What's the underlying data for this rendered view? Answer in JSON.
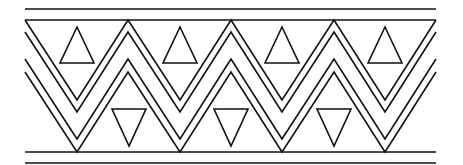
{
  "figure": {
    "colors": {
      "stroke": "#111111",
      "background": "#ffffff"
    },
    "bounds": {
      "left": 25,
      "right": 436
    },
    "horizontal_lines_y": [
      9,
      20,
      152,
      163
    ],
    "zigzag": {
      "peak_x": [
        25,
        128,
        231,
        334,
        436
      ],
      "valley_x": [
        77,
        180,
        282,
        385
      ],
      "bands": [
        {
          "peak_y": 20,
          "valley_y": 100
        },
        {
          "peak_y": 32,
          "valley_y": 112
        },
        {
          "peak_y": 59,
          "valley_y": 139
        },
        {
          "peak_y": 72,
          "valley_y": 152
        }
      ]
    },
    "up_triangles": [
      {
        "cx": 77,
        "apex_y": 27,
        "base_y": 63,
        "half_width": 17
      },
      {
        "cx": 180,
        "apex_y": 27,
        "base_y": 63,
        "half_width": 17
      },
      {
        "cx": 282,
        "apex_y": 27,
        "base_y": 63,
        "half_width": 17
      },
      {
        "cx": 385,
        "apex_y": 27,
        "base_y": 63,
        "half_width": 17
      }
    ],
    "down_triangles": [
      {
        "cx": 129,
        "top_y": 109,
        "apex_y": 146,
        "half_width": 17
      },
      {
        "cx": 231,
        "top_y": 109,
        "apex_y": 146,
        "half_width": 17
      },
      {
        "cx": 334,
        "top_y": 109,
        "apex_y": 146,
        "half_width": 17
      }
    ]
  }
}
